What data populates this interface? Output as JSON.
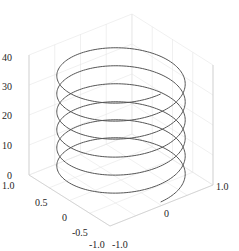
{
  "chart_data": {
    "type": "line3d",
    "title": "",
    "xlabel": "",
    "ylabel": "",
    "zlabel": "",
    "xlim": [
      -1.0,
      1.0
    ],
    "ylim": [
      -1.0,
      1.0
    ],
    "zlim": [
      0,
      40
    ],
    "grid": true,
    "series": [
      {
        "name": "helix",
        "description": "x = sin(t), y = cos(t), z = t",
        "t_range": [
          0,
          37.7
        ],
        "turns": 6,
        "radius": 1.0,
        "color": "#555555"
      }
    ],
    "x_ticks": [
      "-1.0",
      "0",
      "1.0"
    ],
    "y_ticks": [
      "1.0",
      "0.5",
      "0",
      "-0.5",
      "-1.0"
    ],
    "z_ticks": [
      "0",
      "10",
      "20",
      "30",
      "40"
    ]
  },
  "colors": {
    "line": "#555555",
    "grid": "#e6e6e6",
    "axis": "#c8c8c8",
    "text": "#262626"
  }
}
